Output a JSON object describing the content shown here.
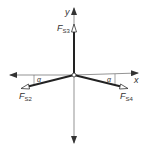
{
  "diagram": {
    "type": "force-diagram",
    "axes": {
      "x_label": "x",
      "y_label": "y"
    },
    "forces": [
      {
        "name": "F",
        "sub": "S3",
        "direction": "up"
      },
      {
        "name": "F",
        "sub": "S2",
        "direction": "down-left",
        "angle_label": "α"
      },
      {
        "name": "F",
        "sub": "S4",
        "direction": "down-right",
        "angle_label": "α"
      }
    ],
    "colors": {
      "axis": "#555555",
      "force": "#222222",
      "text": "#333333"
    }
  }
}
